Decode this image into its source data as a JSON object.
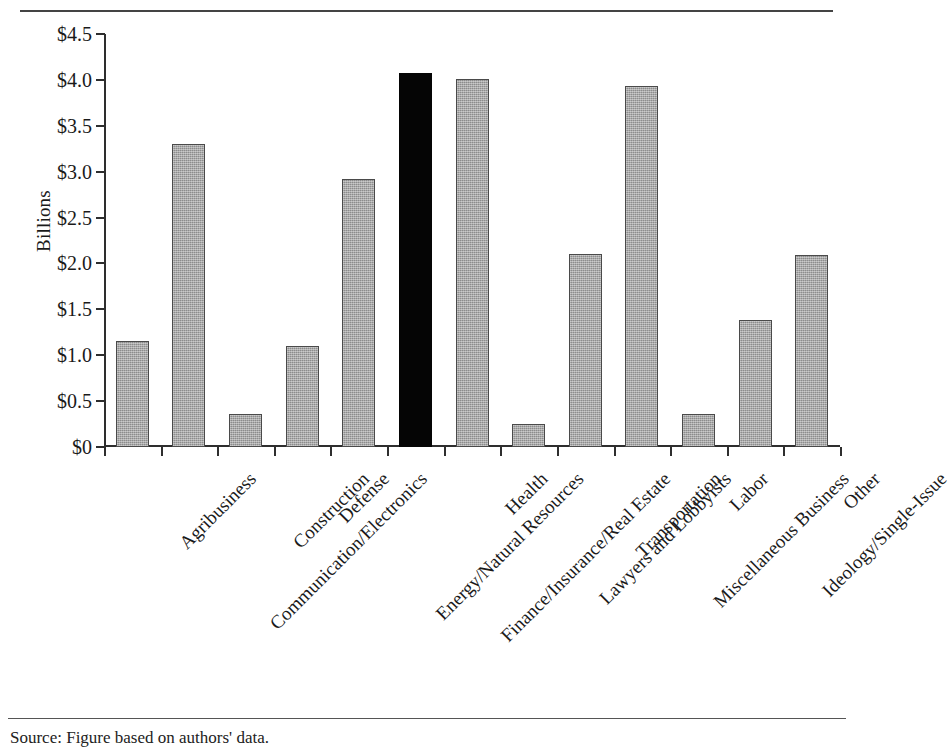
{
  "figure": {
    "rules": {
      "top": true,
      "bottom": true
    },
    "source_note": "Source:  Figure based on authors' data."
  },
  "chart_data": {
    "type": "bar",
    "title": "",
    "xlabel": "",
    "ylabel": "Billions",
    "ylim": [
      0,
      4.5
    ],
    "grid": false,
    "legend": "none",
    "ytick_labels": [
      "$0",
      "$0.5",
      "$1.0",
      "$1.5",
      "$2.0",
      "$2.5",
      "$3.0",
      "$3.5",
      "$4.0",
      "$4.5"
    ],
    "ytick_values": [
      0,
      0.5,
      1.0,
      1.5,
      2.0,
      2.5,
      3.0,
      3.5,
      4.0,
      4.5
    ],
    "categories": [
      "Agribusiness",
      "Communication/Electronics",
      "Construction",
      "Defense",
      "Energy/Natural Resources",
      "Finance/Insurance/Real Estate",
      "Health",
      "Lawyers and Lobbyists",
      "Transportation",
      "Miscellaneous Business",
      "Labor",
      "Ideology/Single-Issue",
      "Other"
    ],
    "values": [
      1.16,
      3.3,
      0.36,
      1.1,
      2.92,
      4.08,
      4.01,
      0.25,
      2.1,
      3.93,
      0.36,
      1.38,
      2.09
    ],
    "highlight_index": 5,
    "colors": {
      "bar_fill": "#9d9d9d",
      "bar_border": "#4a4a4a",
      "highlight_fill": "#050505",
      "axis": "#2e2e2e",
      "text": "#1a1a1a",
      "background": "#ffffff"
    }
  }
}
